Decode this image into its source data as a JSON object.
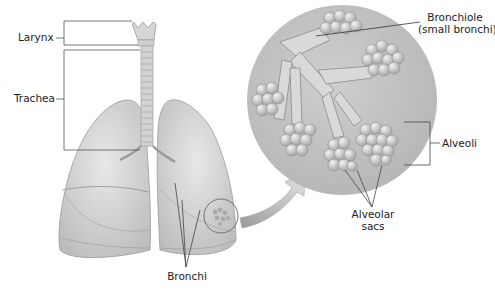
{
  "diagram": {
    "labels": {
      "larynx": "Larynx",
      "trachea": "Trachea",
      "bronchi": "Bronchi",
      "bronchiole_line1": "Bronchiole",
      "bronchiole_line2": "(small bronchi)",
      "alveoli": "Alveoli",
      "alveolar_sacs_line1": "Alveolar",
      "alveolar_sacs_line2": "sacs"
    },
    "colors": {
      "background": "#ffffff",
      "lung_fill": "#d9d9d9",
      "lung_shade": "#bdbdbd",
      "trachea": "#cfcfcf",
      "magnified_circle": "#c4c4c4",
      "alveoli_cluster": "#dadada",
      "leader_line": "#333333",
      "arrow": "#cfcfcf"
    }
  }
}
